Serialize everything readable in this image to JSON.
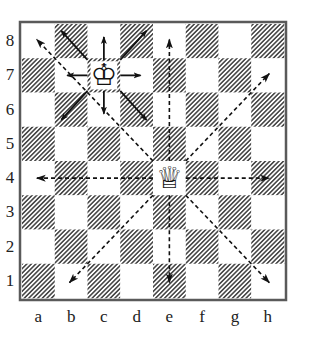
{
  "board": {
    "files": [
      "a",
      "b",
      "c",
      "d",
      "e",
      "f",
      "g",
      "h"
    ],
    "ranks": [
      "8",
      "7",
      "6",
      "5",
      "4",
      "3",
      "2",
      "1"
    ],
    "light_color": "#ffffff",
    "dark_hatch_color": "#4a4a4a",
    "border_color": "#5a5a5a"
  },
  "pieces": [
    {
      "name": "white-king",
      "square": "c7",
      "glyph": "♔"
    },
    {
      "name": "white-queen",
      "square": "e4",
      "glyph": "♕"
    }
  ],
  "king_moves": {
    "style": "solid",
    "from": "c7",
    "targets": [
      "b8",
      "c8",
      "d8",
      "b7",
      "d7",
      "b6",
      "c6",
      "d6"
    ]
  },
  "queen_moves": {
    "style": "dashed",
    "from": "e4",
    "targets": [
      "e8",
      "e1",
      "a4",
      "h4",
      "h7",
      "h1",
      "b1",
      "a8"
    ]
  }
}
